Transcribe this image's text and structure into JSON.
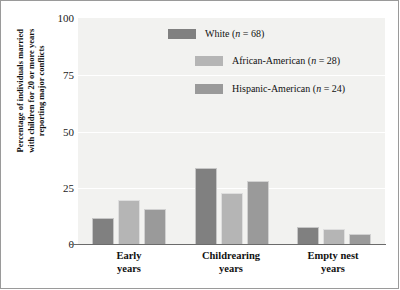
{
  "chart_data": {
    "type": "bar",
    "title": "",
    "xlabel": "",
    "ylabel": "Percentage of individuals married with children for 20 or more years reporting major conflicts",
    "categories": [
      "Early years",
      "Childrearing years",
      "Empty nest years"
    ],
    "series": [
      {
        "name": "White (n = 68)",
        "color": "#808080",
        "values": [
          12,
          34,
          8
        ]
      },
      {
        "name": "African-American (n = 28)",
        "color": "#b5b5b5",
        "values": [
          20,
          23,
          7
        ]
      },
      {
        "name": "Hispanic-American (n = 24)",
        "color": "#9a9a9a",
        "values": [
          16,
          28,
          5
        ]
      }
    ],
    "ylim": [
      0,
      100
    ],
    "yticks": [
      0,
      25,
      50,
      75,
      100
    ],
    "ytick_labels": [
      "0",
      "25",
      "50",
      "75",
      "100"
    ],
    "grid": true,
    "legend_position": "top-center-right"
  },
  "legend": {
    "items": [
      {
        "label_main": "White",
        "label_n": "(n = 68)",
        "full": "White (n = 68)"
      },
      {
        "label_main": "African-American",
        "label_n": "(n = 28)",
        "full": "African-American (n = 28)"
      },
      {
        "label_main": "Hispanic-American",
        "label_n": "(n = 24)",
        "full": "Hispanic-American (n = 24)"
      }
    ]
  },
  "axis": {
    "y_title_line1": "Percentage of individuals married",
    "y_title_line2": "with children for 20 or more years",
    "y_title_line3": "reporting major conflicts",
    "x_labels": [
      {
        "line1": "Early",
        "line2": "years"
      },
      {
        "line1": "Childrearing",
        "line2": "years"
      },
      {
        "line1": "Empty nest",
        "line2": "years"
      }
    ],
    "y_ticks": [
      "100",
      "75",
      "50",
      "25",
      "0"
    ]
  },
  "colors": {
    "white_series": "#808080",
    "african_american_series": "#b5b5b5",
    "hispanic_american_series": "#9a9a9a",
    "plot_background": "#f2f2f0",
    "gridline": "#ffffff",
    "axis_line": "#6b6b6b",
    "frame": "#9a9a9a",
    "text": "#111111"
  }
}
